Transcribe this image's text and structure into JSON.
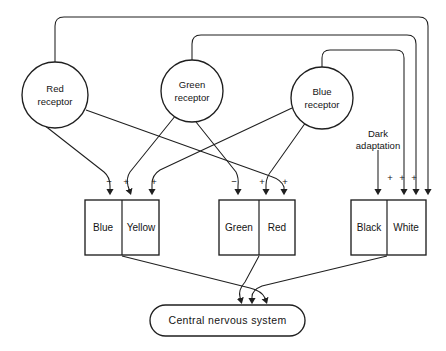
{
  "diagram": {
    "receptors": [
      {
        "id": "red-receptor",
        "line1": "Red",
        "line2": "receptor",
        "cx": 55,
        "cy": 95,
        "r": 33
      },
      {
        "id": "green-receptor",
        "line1": "Green",
        "line2": "receptor",
        "cx": 192,
        "cy": 91,
        "r": 31
      },
      {
        "id": "blue-receptor",
        "line1": "Blue",
        "line2": "receptor",
        "cx": 322,
        "cy": 98,
        "r": 31
      }
    ],
    "channels": [
      {
        "id": "blue-yellow",
        "left_label": "Blue",
        "right_label": "Yellow",
        "x": 85,
        "y": 200,
        "w": 74,
        "h": 55,
        "split": 37,
        "signs": [
          {
            "text": "−",
            "x": 109,
            "y": 182
          },
          {
            "text": "+",
            "x": 126,
            "y": 182
          },
          {
            "text": "+",
            "x": 154,
            "y": 182
          }
        ]
      },
      {
        "id": "green-red",
        "left_label": "Green",
        "right_label": "Red",
        "x": 219,
        "y": 200,
        "w": 76,
        "h": 55,
        "split": 40,
        "signs": [
          {
            "text": "−",
            "x": 234,
            "y": 182
          },
          {
            "text": "+",
            "x": 262,
            "y": 182
          },
          {
            "text": "+",
            "x": 285,
            "y": 182
          }
        ]
      },
      {
        "id": "black-white",
        "left_label": "Black",
        "right_label": "White",
        "x": 351,
        "y": 200,
        "w": 75,
        "h": 55,
        "split": 36,
        "signs": [
          {
            "text": "+",
            "x": 390,
            "y": 178
          },
          {
            "text": "+",
            "x": 402,
            "y": 178
          },
          {
            "text": "+",
            "x": 414,
            "y": 178
          }
        ]
      }
    ],
    "inputs": [
      {
        "id": "dark-adaptation",
        "line1": "Dark",
        "line2": "adaptation",
        "x": 378,
        "y": 134
      }
    ],
    "output": {
      "id": "central-nervous-system",
      "label": "Central nervous system",
      "x": 150,
      "y": 305,
      "w": 155,
      "h": 31,
      "rx": 15.5
    },
    "colors": {
      "stroke": "#1f1f1f",
      "text": "#141414",
      "background": "#ffffff"
    }
  }
}
